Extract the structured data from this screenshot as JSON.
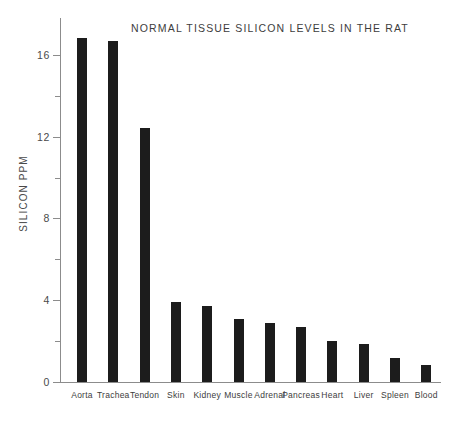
{
  "chart_data": {
    "type": "bar",
    "title": "NORMAL TISSUE SILICON LEVELS IN THE RAT",
    "xlabel": "",
    "ylabel": "SILICON PPM",
    "categories": [
      "Aorta",
      "Trachea",
      "Tendon",
      "Skin",
      "Kidney",
      "Muscle",
      "Adrenal",
      "Pancreas",
      "Heart",
      "Liver",
      "Spleen",
      "Blood"
    ],
    "values": [
      16.8,
      16.7,
      12.4,
      3.9,
      3.7,
      3.1,
      2.9,
      2.7,
      2.0,
      1.85,
      1.15,
      0.85
    ],
    "ylim": [
      0,
      17.8
    ],
    "ytick_major": [
      0,
      4,
      8,
      12,
      16
    ],
    "ytick_minor": [
      2,
      6,
      10,
      14
    ],
    "ytick_labels": [
      "0",
      "4",
      "8",
      "12",
      "16"
    ],
    "grid": false,
    "legend": false,
    "bar_color": "#1c1c1c",
    "axis_color": "#8c8c8c"
  }
}
